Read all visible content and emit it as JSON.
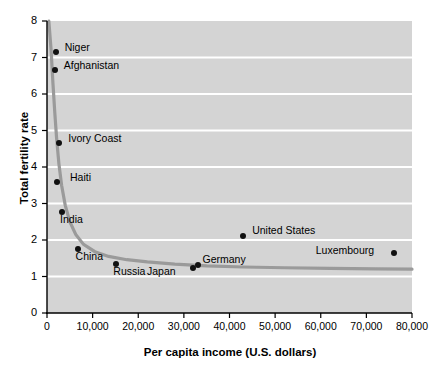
{
  "chart_data": {
    "type": "scatter",
    "title": "",
    "xlabel": "Per capita income (U.S. dollars)",
    "ylabel": "Total fertility rate",
    "xlim": [
      0,
      80000
    ],
    "ylim": [
      0,
      8
    ],
    "xticks": [
      0,
      10000,
      20000,
      30000,
      40000,
      50000,
      60000,
      70000,
      80000
    ],
    "xticklabels": [
      "0",
      "10,000",
      "20,000",
      "30,000",
      "40,000",
      "50,000",
      "60,000",
      "70,000",
      "80,000"
    ],
    "yticks": [
      0,
      1,
      2,
      3,
      4,
      5,
      6,
      7,
      8
    ],
    "yticklabels": [
      "0",
      "1",
      "2",
      "3",
      "4",
      "5",
      "6",
      "7",
      "8"
    ],
    "grid": "horizontal-white-gridlines",
    "legend": "none",
    "plot_background": "#d4d4d4",
    "gridline_color": "#ffffff",
    "marker_color": "#111111",
    "trend_line_color": "#9a9a9a",
    "points": [
      {
        "label": "Niger",
        "x": 1900,
        "y": 7.15,
        "label_dx": 9,
        "label_dy": -5
      },
      {
        "label": "Afghanistan",
        "x": 1700,
        "y": 6.65,
        "label_dx": 9,
        "label_dy": -5
      },
      {
        "label": "Ivory Coast",
        "x": 2700,
        "y": 4.65,
        "label_dx": 9,
        "label_dy": -5
      },
      {
        "label": "Haiti",
        "x": 2200,
        "y": 3.58,
        "label_dx": 13,
        "label_dy": -5
      },
      {
        "label": "India",
        "x": 3300,
        "y": 2.78,
        "label_dx": -2,
        "label_dy": 7
      },
      {
        "label": "China",
        "x": 6700,
        "y": 1.75,
        "label_dx": -2,
        "label_dy": 7
      },
      {
        "label": "Russia",
        "x": 15200,
        "y": 1.33,
        "label_dx": -3,
        "label_dy": 7
      },
      {
        "label": "Japan",
        "x": 32000,
        "y": 1.22,
        "label_dx": -46,
        "label_dy": 3
      },
      {
        "label": "Germany",
        "x": 33200,
        "y": 1.32,
        "label_dx": 4,
        "label_dy": -6
      },
      {
        "label": "United States",
        "x": 43000,
        "y": 2.12,
        "label_dx": 9,
        "label_dy": -6
      },
      {
        "label": "Luxembourg",
        "x": 76000,
        "y": 1.65,
        "label_dx": -78,
        "label_dy": -3
      }
    ],
    "trend_curve_note": "Steeply decaying hyperbolic fit from ~8.0 at low income, flattening near 1.2 at high income",
    "trend_curve": [
      {
        "x": 400,
        "y": 8.0
      },
      {
        "x": 900,
        "y": 7.2
      },
      {
        "x": 1300,
        "y": 6.3
      },
      {
        "x": 1700,
        "y": 5.5
      },
      {
        "x": 2100,
        "y": 4.8
      },
      {
        "x": 2600,
        "y": 4.1
      },
      {
        "x": 3200,
        "y": 3.5
      },
      {
        "x": 4000,
        "y": 2.95
      },
      {
        "x": 5000,
        "y": 2.5
      },
      {
        "x": 6300,
        "y": 2.15
      },
      {
        "x": 8000,
        "y": 1.88
      },
      {
        "x": 10500,
        "y": 1.68
      },
      {
        "x": 13500,
        "y": 1.55
      },
      {
        "x": 17500,
        "y": 1.46
      },
      {
        "x": 22000,
        "y": 1.4
      },
      {
        "x": 28000,
        "y": 1.34
      },
      {
        "x": 35000,
        "y": 1.29
      },
      {
        "x": 43000,
        "y": 1.26
      },
      {
        "x": 52000,
        "y": 1.24
      },
      {
        "x": 62000,
        "y": 1.22
      },
      {
        "x": 72000,
        "y": 1.21
      },
      {
        "x": 80000,
        "y": 1.2
      }
    ]
  }
}
